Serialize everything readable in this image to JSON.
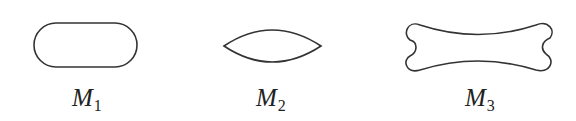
{
  "figure": {
    "shapes": [
      {
        "id": "M1",
        "kind": "stadium",
        "label_main": "M",
        "label_sub": "1"
      },
      {
        "id": "M2",
        "kind": "lens",
        "label_main": "M",
        "label_sub": "2"
      },
      {
        "id": "M3",
        "kind": "bone",
        "label_main": "M",
        "label_sub": "3"
      }
    ],
    "stroke_color": "#333333"
  }
}
